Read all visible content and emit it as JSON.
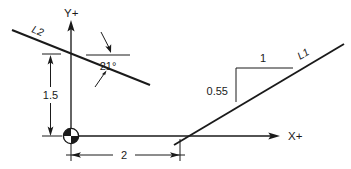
{
  "diagram": {
    "background_color": "#ffffff",
    "ink_color": "#1a1a1a",
    "axes": {
      "y_axis_label": "Y+",
      "x_axis_label": "X+"
    },
    "lines": [
      {
        "id": "L2",
        "label": "L2",
        "description": "line descending to the right",
        "angle_label": "21°"
      },
      {
        "id": "L1",
        "label": "L1",
        "description": "line ascending to the right",
        "rise": "0.55",
        "run": "1"
      }
    ],
    "annotations": {
      "angle": "21°",
      "vertical_dimension": "1.5",
      "horizontal_dimension": "2",
      "slope_rise": "0.55",
      "slope_run": "1"
    },
    "origin": {
      "marker": "survey-point-symbol"
    }
  }
}
